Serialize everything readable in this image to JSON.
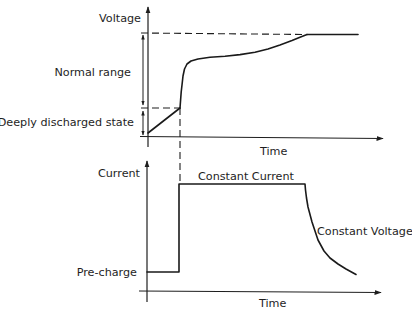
{
  "colors": {
    "line": "#1e1e1e",
    "background": "#ffffff"
  },
  "voltage_panel": {
    "y_axis_label": "Voltage",
    "x_axis_label": "Time",
    "annotations": {
      "normal_range": "Normal range",
      "deeply_discharged": "Deeply discharged state"
    },
    "precharge_ramp_points": "148,133 180,108",
    "charge_curve_points": "180,108 180.6,100 181.2,92 182,85 183,76 184.5,69 187,64 191,61 198,59 210,57.3 225,56.2 240,54.6 255,52.2 268,49 280,45 292,40.5 300,37.2 307,34.5",
    "plateau_points": "307,34.5 358,34.5",
    "max_voltage_dash_points": "141,33 307,34.5",
    "threshold_dash_points": "141,108 180,108"
  },
  "current_panel": {
    "y_axis_label": "Current",
    "x_axis_label": "Time",
    "annotations": {
      "pre_charge": "Pre-charge",
      "constant_current": "Constant Current",
      "constant_voltage": "Constant Voltage"
    },
    "profile_points": "147,272 179,272 179,184 305,184 305.5,190 306.5,198 308,207 312,222 318,240 324,251 330,258 338,264 346,269 356,274.5"
  },
  "transition_dash_points": "180,108 180,184"
}
